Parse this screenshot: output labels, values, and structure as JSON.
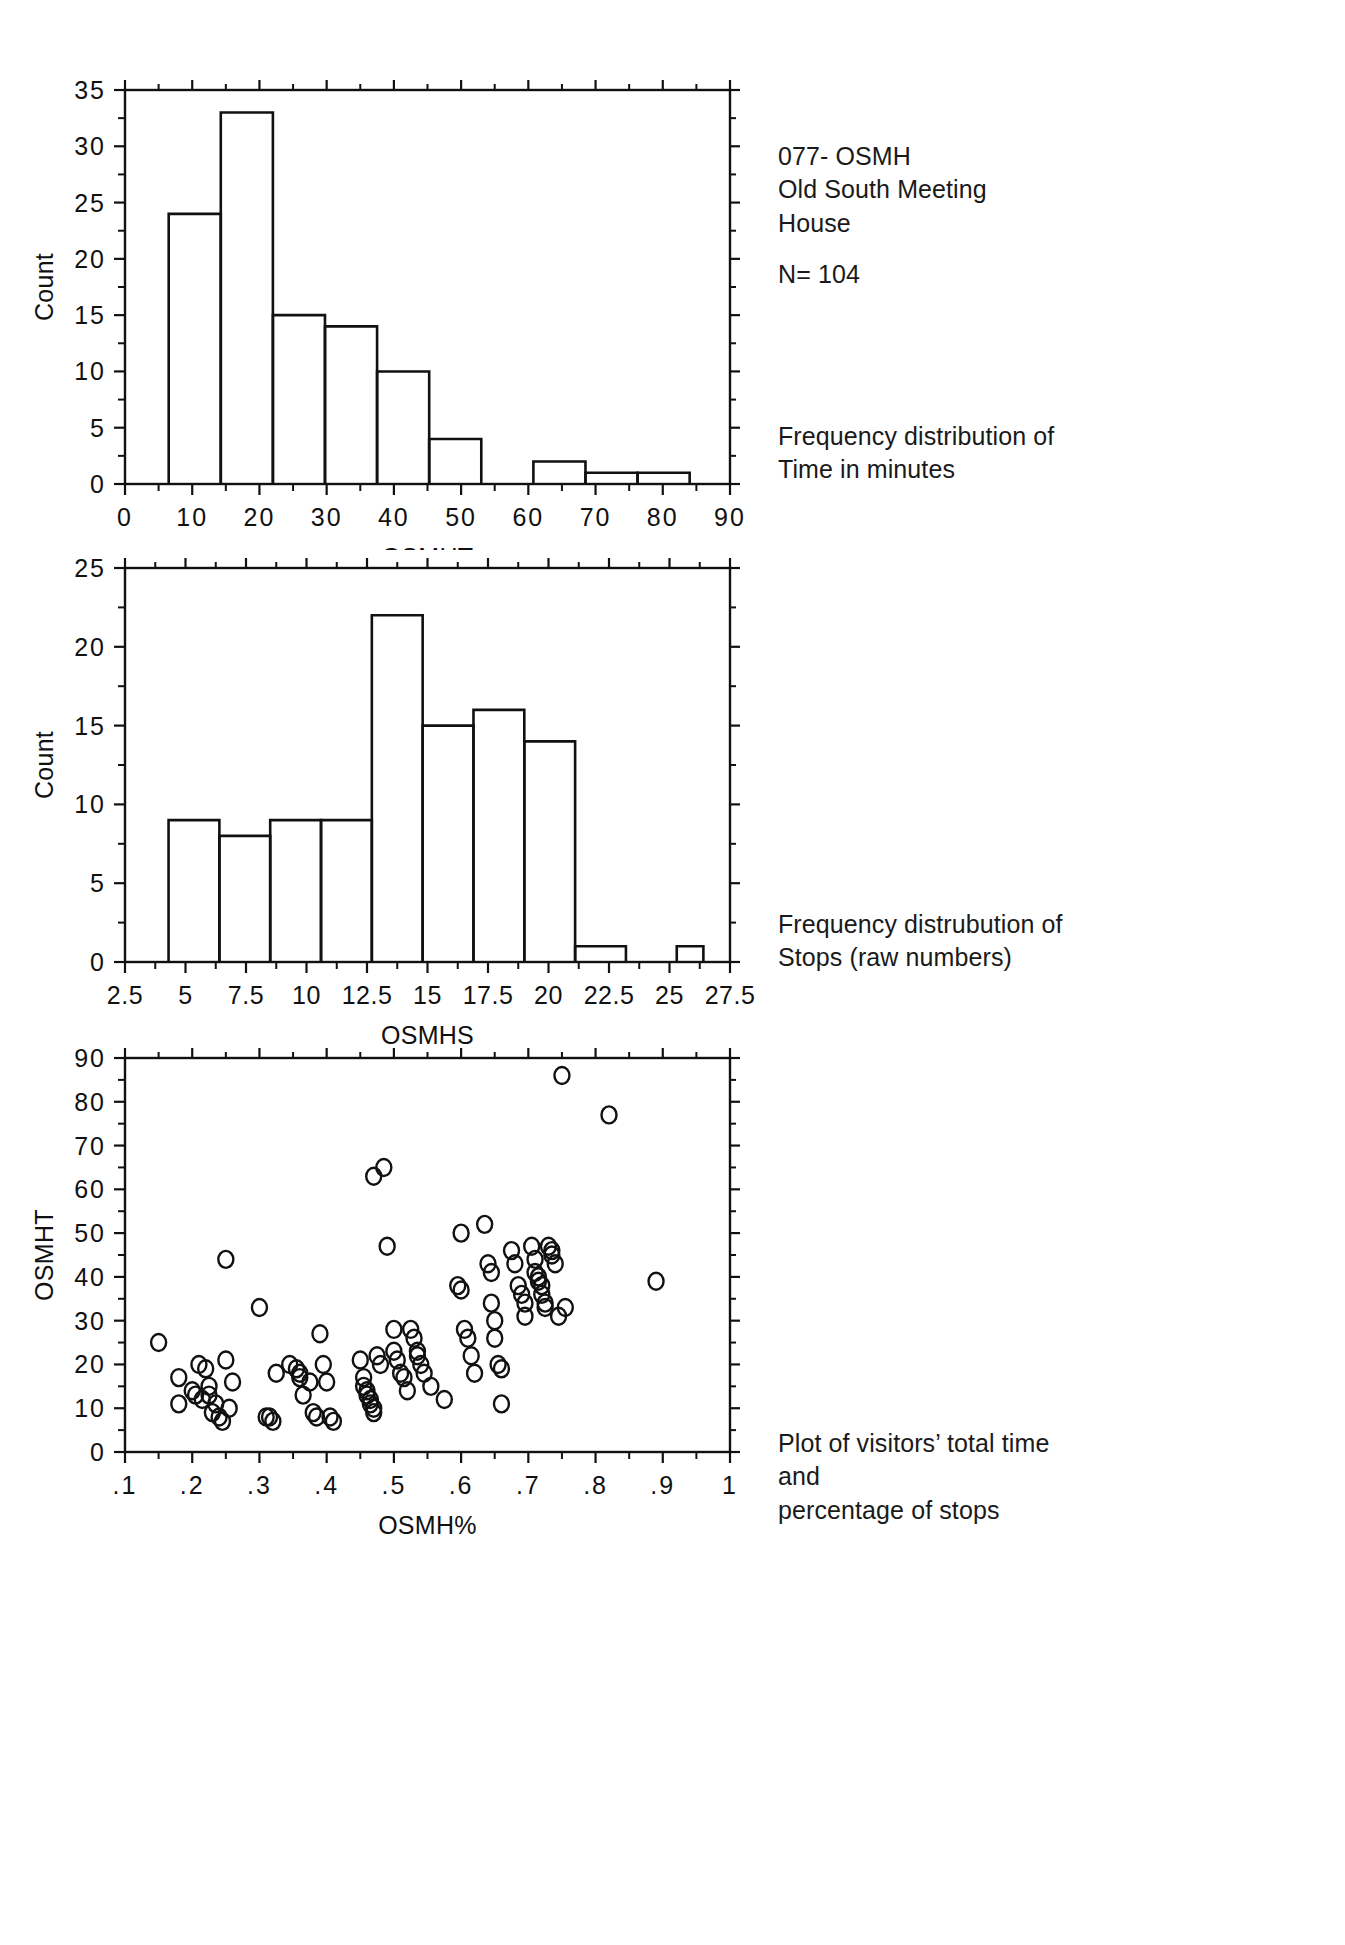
{
  "figure": {
    "header_title": "077- OSMH\nOld South Meeting\nHouse",
    "sample_size": "N= 104"
  },
  "captions": {
    "panel1": "Frequency distribution of\nTime in minutes",
    "panel2": "Frequency distrubution of\nStops (raw numbers)",
    "panel3": "Plot of visitors’ total time and\npercentage of stops"
  },
  "chart_data": [
    {
      "type": "bar",
      "id": "osmht-histogram",
      "title": "",
      "xlabel": "OSMHT",
      "ylabel": "Count",
      "xlim": [
        0,
        90
      ],
      "ylim": [
        0,
        35
      ],
      "xticks": [
        0,
        10,
        20,
        30,
        40,
        50,
        60,
        70,
        80,
        90
      ],
      "xtick_labels": [
        "0",
        "10",
        "20",
        "30",
        "40",
        "50",
        "60",
        "70",
        "80",
        "90"
      ],
      "yticks": [
        0,
        5,
        10,
        15,
        20,
        25,
        30,
        35
      ],
      "ytick_labels": [
        "0",
        "5",
        "10",
        "15",
        "20",
        "25",
        "30",
        "35"
      ],
      "grid": false,
      "bin_width": 7.75,
      "bin_edges": [
        6.5,
        14.25,
        22.0,
        29.75,
        37.5,
        45.25,
        53.0,
        60.75,
        68.5,
        76.25,
        84.0
      ],
      "values": [
        24,
        33,
        15,
        14,
        10,
        4,
        0,
        2,
        1,
        1
      ]
    },
    {
      "type": "bar",
      "id": "osmhs-histogram",
      "title": "",
      "xlabel": "OSMHS",
      "ylabel": "Count",
      "xlim": [
        2.5,
        27.5
      ],
      "ylim": [
        0,
        25
      ],
      "xticks": [
        2.5,
        5,
        7.5,
        10,
        12.5,
        15,
        17.5,
        20,
        22.5,
        25,
        27.5
      ],
      "xtick_labels": [
        "2.5",
        "5",
        "7.5",
        "10",
        "12.5",
        "15",
        "17.5",
        "20",
        "22.5",
        "25",
        "27.5"
      ],
      "yticks": [
        0,
        5,
        10,
        15,
        20,
        25
      ],
      "ytick_labels": [
        "0",
        "5",
        "10",
        "15",
        "20",
        "25"
      ],
      "grid": false,
      "bin_width": 2.1,
      "bin_edges": [
        4.3,
        6.4,
        8.5,
        10.6,
        12.7,
        14.8,
        16.9,
        19.0,
        21.1,
        23.2,
        25.3,
        26.4
      ],
      "values": [
        9,
        8,
        9,
        9,
        22,
        15,
        16,
        14,
        1,
        0,
        1
      ]
    },
    {
      "type": "scatter",
      "id": "osmh-scatter",
      "title": "",
      "xlabel": "OSMH%",
      "ylabel": "OSMHT",
      "xlim": [
        0.1,
        1.0
      ],
      "ylim": [
        0,
        90
      ],
      "xticks": [
        0.1,
        0.2,
        0.3,
        0.4,
        0.5,
        0.6,
        0.7,
        0.8,
        0.9,
        1.0
      ],
      "xtick_labels": [
        ".1",
        ".2",
        ".3",
        ".4",
        ".5",
        ".6",
        ".7",
        ".8",
        ".9",
        "1"
      ],
      "yticks": [
        0,
        10,
        20,
        30,
        40,
        50,
        60,
        70,
        80,
        90
      ],
      "ytick_labels": [
        "0",
        "10",
        "20",
        "30",
        "40",
        "50",
        "60",
        "70",
        "80",
        "90"
      ],
      "grid": false,
      "marker": "open-circle",
      "points": [
        [
          0.15,
          25
        ],
        [
          0.18,
          17
        ],
        [
          0.18,
          11
        ],
        [
          0.2,
          14
        ],
        [
          0.205,
          13
        ],
        [
          0.21,
          20
        ],
        [
          0.215,
          12
        ],
        [
          0.22,
          19
        ],
        [
          0.225,
          15
        ],
        [
          0.225,
          13
        ],
        [
          0.23,
          9
        ],
        [
          0.235,
          11
        ],
        [
          0.24,
          8
        ],
        [
          0.245,
          7
        ],
        [
          0.25,
          44
        ],
        [
          0.25,
          21
        ],
        [
          0.255,
          10
        ],
        [
          0.26,
          16
        ],
        [
          0.3,
          33
        ],
        [
          0.31,
          8
        ],
        [
          0.315,
          8
        ],
        [
          0.32,
          7
        ],
        [
          0.325,
          18
        ],
        [
          0.345,
          20
        ],
        [
          0.355,
          19
        ],
        [
          0.36,
          18
        ],
        [
          0.36,
          17
        ],
        [
          0.365,
          13
        ],
        [
          0.375,
          16
        ],
        [
          0.38,
          9
        ],
        [
          0.385,
          8
        ],
        [
          0.39,
          27
        ],
        [
          0.395,
          20
        ],
        [
          0.4,
          16
        ],
        [
          0.405,
          8
        ],
        [
          0.41,
          7
        ],
        [
          0.45,
          21
        ],
        [
          0.455,
          17
        ],
        [
          0.455,
          15
        ],
        [
          0.46,
          14
        ],
        [
          0.46,
          13
        ],
        [
          0.465,
          12
        ],
        [
          0.465,
          11
        ],
        [
          0.47,
          10
        ],
        [
          0.47,
          9
        ],
        [
          0.47,
          63
        ],
        [
          0.475,
          22
        ],
        [
          0.48,
          20
        ],
        [
          0.485,
          65
        ],
        [
          0.49,
          47
        ],
        [
          0.5,
          28
        ],
        [
          0.5,
          23
        ],
        [
          0.505,
          21
        ],
        [
          0.51,
          18
        ],
        [
          0.515,
          17
        ],
        [
          0.52,
          14
        ],
        [
          0.525,
          28
        ],
        [
          0.53,
          26
        ],
        [
          0.535,
          23
        ],
        [
          0.535,
          22
        ],
        [
          0.54,
          20
        ],
        [
          0.545,
          18
        ],
        [
          0.555,
          15
        ],
        [
          0.575,
          12
        ],
        [
          0.595,
          38
        ],
        [
          0.6,
          37
        ],
        [
          0.6,
          50
        ],
        [
          0.605,
          28
        ],
        [
          0.61,
          26
        ],
        [
          0.615,
          22
        ],
        [
          0.62,
          18
        ],
        [
          0.635,
          52
        ],
        [
          0.64,
          43
        ],
        [
          0.645,
          41
        ],
        [
          0.645,
          34
        ],
        [
          0.65,
          30
        ],
        [
          0.65,
          26
        ],
        [
          0.655,
          20
        ],
        [
          0.66,
          19
        ],
        [
          0.66,
          11
        ],
        [
          0.675,
          46
        ],
        [
          0.68,
          43
        ],
        [
          0.685,
          38
        ],
        [
          0.69,
          36
        ],
        [
          0.695,
          34
        ],
        [
          0.695,
          31
        ],
        [
          0.705,
          47
        ],
        [
          0.71,
          44
        ],
        [
          0.71,
          41
        ],
        [
          0.715,
          40
        ],
        [
          0.715,
          39
        ],
        [
          0.72,
          38
        ],
        [
          0.72,
          36
        ],
        [
          0.725,
          34
        ],
        [
          0.725,
          33
        ],
        [
          0.73,
          47
        ],
        [
          0.735,
          46
        ],
        [
          0.735,
          45
        ],
        [
          0.74,
          43
        ],
        [
          0.745,
          31
        ],
        [
          0.75,
          86
        ],
        [
          0.755,
          33
        ],
        [
          0.82,
          77
        ],
        [
          0.89,
          39
        ]
      ]
    }
  ]
}
